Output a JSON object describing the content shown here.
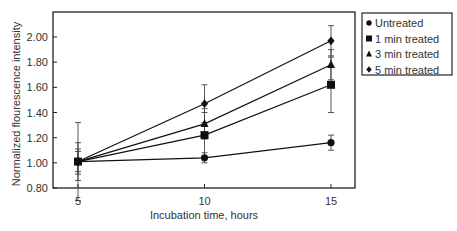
{
  "chart_data": {
    "type": "line",
    "title": "",
    "xlabel": "Incubation time, hours",
    "ylabel": "Normalized flourescence intensity",
    "x": [
      5,
      10,
      15
    ],
    "xticks": [
      "5",
      "10",
      "15"
    ],
    "yticks": [
      "0.80",
      "1.00",
      "1.20",
      "1.40",
      "1.60",
      "1.80",
      "2.00"
    ],
    "ylim": [
      0.8,
      2.15
    ],
    "xlim": [
      4,
      16
    ],
    "grid": false,
    "legend_position": "right-outside-top",
    "series": [
      {
        "name": "Untreated",
        "marker": "circle",
        "values": [
          1.01,
          1.04,
          1.16
        ],
        "err": [
          0.08,
          0.04,
          0.06
        ]
      },
      {
        "name": "1 min treated",
        "marker": "square",
        "values": [
          1.01,
          1.22,
          1.62
        ],
        "err": [
          0.1,
          0.18,
          0.22
        ]
      },
      {
        "name": "3 min treated",
        "marker": "triangle",
        "values": [
          1.01,
          1.31,
          1.78
        ],
        "err": [
          0.15,
          0.12,
          0.12
        ]
      },
      {
        "name": "5 min treated",
        "marker": "diamond",
        "values": [
          1.01,
          1.47,
          1.97
        ],
        "err": [
          0.31,
          0.15,
          0.12
        ]
      }
    ]
  }
}
